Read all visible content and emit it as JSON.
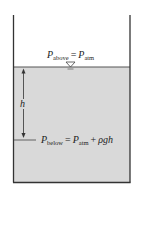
{
  "diagram": {
    "title": "",
    "colors": {
      "liquid": "#d9d9d9",
      "wall": "#333333",
      "background": "#ffffff"
    },
    "labels": {
      "top": {
        "p": "P",
        "sub": "above",
        "eq": "=",
        "p2": "P",
        "sub2": "atm"
      },
      "height": "h",
      "bottom": {
        "p": "P",
        "sub": "below",
        "eq": "=",
        "p2": "P",
        "sub2": "atm",
        "plus": "+",
        "term": "ρgh"
      }
    },
    "icons": {
      "free_surface": "inverted-triangle"
    }
  }
}
